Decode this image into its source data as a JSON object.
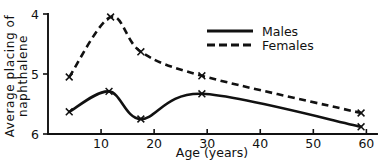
{
  "chart_data": {
    "type": "line",
    "title": "",
    "xlabel": "Age (years)",
    "ylabel_line1": "Average placing of",
    "ylabel_line2": "naphthalene",
    "xlim": [
      0,
      62
    ],
    "ylim": [
      4,
      6
    ],
    "y_inverted": true,
    "grid": false,
    "legend_position": "top-right",
    "xticks": [
      10,
      20,
      30,
      40,
      50,
      60
    ],
    "xtick_labels": [
      "10",
      "20",
      "30",
      "40",
      "50",
      "60"
    ],
    "yticks": [
      4,
      5,
      6
    ],
    "ytick_labels": [
      "4",
      "5",
      "6"
    ],
    "series": [
      {
        "name": "Males",
        "style": "solid",
        "marker": "x",
        "x": [
          4.0,
          11.5,
          17.5,
          29.0,
          59.0
        ],
        "values": [
          5.63,
          5.29,
          5.75,
          5.33,
          5.88
        ]
      },
      {
        "name": "Females",
        "style": "dashed",
        "marker": "x",
        "x": [
          4.0,
          11.8,
          17.5,
          29.0,
          59.0
        ],
        "values": [
          5.05,
          4.05,
          4.63,
          5.03,
          5.65
        ]
      }
    ],
    "legend": [
      {
        "label": "Males",
        "style": "solid"
      },
      {
        "label": "Females",
        "style": "dashed"
      }
    ]
  },
  "axes": {
    "x_axis_title": "Age (years)",
    "y_axis_title_line1": "Average placing of",
    "y_axis_title_line2": "naphthalene"
  }
}
